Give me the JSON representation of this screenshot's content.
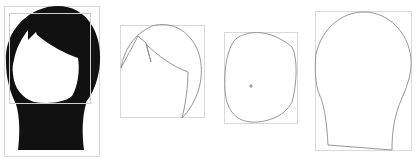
{
  "figures": [
    {
      "name": "full-hair-silhouette",
      "fill": "#111111",
      "box_color": "#d6d6d6"
    },
    {
      "name": "bangs-outline",
      "stroke": "#8a8a8a",
      "box_color": "#d9d9d9"
    },
    {
      "name": "face-outline",
      "stroke": "#8a8a8a",
      "box_color": "#d9d9d9",
      "marker": "+"
    },
    {
      "name": "head-neck-outline",
      "stroke": "#8a8a8a",
      "box_color": "#d9d9d9"
    }
  ],
  "colors": {
    "background": "#ffffff",
    "silhouette": "#111111",
    "outline": "#8a8a8a",
    "bounding_box": "#d9d9d9"
  }
}
